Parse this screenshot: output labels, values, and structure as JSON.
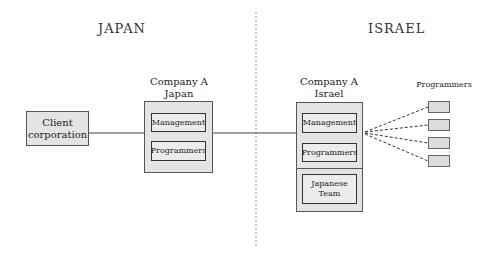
{
  "regions": {
    "left": {
      "title": "JAPAN"
    },
    "right": {
      "title": "ISRAEL"
    }
  },
  "nodes": {
    "client": {
      "label_line1": "Client",
      "label_line2": "corporation"
    },
    "company_japan": {
      "title_line1": "Company A",
      "title_line2": "Japan",
      "units": [
        "Management",
        "Programmers"
      ]
    },
    "company_israel": {
      "title_line1": "Company A",
      "title_line2": "Israel",
      "units": [
        "Management",
        "Programmers"
      ],
      "japanese_team_line1": "Japanese",
      "japanese_team_line2": "Team"
    },
    "programmers_group": {
      "title": "Programmers",
      "count": 4
    }
  },
  "edges": [
    {
      "from": "Client corporation",
      "to": "Company A Japan",
      "style": "solid"
    },
    {
      "from": "Company A Japan",
      "to": "Company A Israel",
      "style": "solid"
    },
    {
      "from": "Company A Israel",
      "to": "Programmers",
      "style": "dashed",
      "count": 4
    }
  ],
  "divider": {
    "style": "dotted",
    "separates": [
      "JAPAN",
      "ISRAEL"
    ]
  }
}
